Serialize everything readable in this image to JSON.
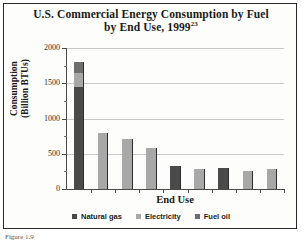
{
  "figure": {
    "caption": "Figure 1.9"
  },
  "chart_data": {
    "type": "bar",
    "title": "U.S. Commercial Energy Consumption by Fuel by End Use, 1999",
    "title_line1": "U.S. Commercial Energy Consumption by Fuel",
    "title_line2": "by End Use, 1999",
    "title_superscript": "23",
    "xlabel": "End Use",
    "ylabel": "Consumption (Billion BTUs)",
    "ylabel_line1": "Consumption",
    "ylabel_line2": "(Billion BTUs)",
    "ylim": [
      0,
      2000
    ],
    "yticks": [
      0,
      500,
      1000,
      1500,
      2000
    ],
    "ytick_labels": [
      "0",
      "500",
      "1000",
      "1500",
      "2000"
    ],
    "yminor_step": 250,
    "grid": "horizontal",
    "stacked": true,
    "legend_position": "bottom",
    "legend": [
      "Natural gas",
      "Electricity",
      "Fuel oil"
    ],
    "colors": {
      "natural_gas": "#4a4a4a",
      "electricity": "#a8a8a8",
      "fuel_oil": "#6e6e6e",
      "gridline": "#c9c9c9",
      "axis": "#4a4a4a"
    },
    "categories": [
      "1",
      "2",
      "3",
      "4",
      "5",
      "6",
      "7",
      "8",
      "9"
    ],
    "series": [
      {
        "name": "Natural gas",
        "color": "#4a4a4a",
        "values": [
          1450,
          0,
          0,
          0,
          330,
          0,
          300,
          0,
          0
        ]
      },
      {
        "name": "Electricity",
        "color": "#a8a8a8",
        "values": [
          200,
          790,
          710,
          580,
          0,
          280,
          0,
          260,
          290
        ]
      },
      {
        "name": "Fuel oil",
        "color": "#6e6e6e",
        "values": [
          150,
          0,
          0,
          0,
          0,
          0,
          0,
          0,
          0
        ]
      }
    ],
    "bar_totals": [
      1800,
      790,
      710,
      580,
      330,
      280,
      300,
      260,
      290
    ]
  }
}
